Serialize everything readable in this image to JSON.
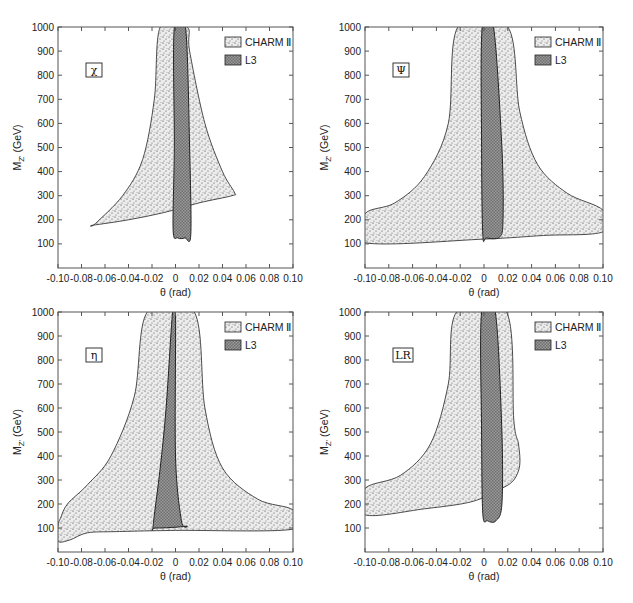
{
  "chart_data": [
    {
      "type": "area",
      "panel": "top-left",
      "model_label": "χ",
      "xlabel": "θ (rad)",
      "ylabel": "M_Z' (GeV)",
      "xlim": [
        -0.1,
        0.1
      ],
      "ylim": [
        0,
        1000
      ],
      "x_ticks": [
        "-0.10",
        "-0.08",
        "-0.06",
        "-0.04",
        "-0.02",
        "0",
        "0.02",
        "0.04",
        "0.06",
        "0.08",
        "0.10"
      ],
      "y_ticks": [
        "100",
        "200",
        "300",
        "400",
        "500",
        "600",
        "700",
        "800",
        "900",
        "1000"
      ],
      "legend": [
        "CHARM II",
        "L3"
      ],
      "series": [
        {
          "name": "CHARM II",
          "points": [
            [
              -0.013,
              1000
            ],
            [
              -0.018,
              700
            ],
            [
              -0.028,
              450
            ],
            [
              -0.045,
              300
            ],
            [
              -0.068,
              185
            ],
            [
              -0.07,
              178
            ],
            [
              -0.04,
              200
            ],
            [
              -0.01,
              230
            ],
            [
              0.02,
              270
            ],
            [
              0.048,
              300
            ],
            [
              0.05,
              315
            ],
            [
              0.04,
              400
            ],
            [
              0.025,
              600
            ],
            [
              0.012,
              900
            ],
            [
              0.01,
              1000
            ]
          ]
        },
        {
          "name": "L3",
          "points": [
            [
              -0.001,
              1000
            ],
            [
              -0.001,
              500
            ],
            [
              -0.002,
              160
            ],
            [
              0.002,
              125
            ],
            [
              0.008,
              125
            ],
            [
              0.013,
              140
            ],
            [
              0.012,
              500
            ],
            [
              0.0085,
              1000
            ]
          ]
        }
      ]
    },
    {
      "type": "area",
      "panel": "top-right",
      "model_label": "ψ",
      "xlabel": "θ (rad)",
      "ylabel": "M_Z' (GeV)",
      "xlim": [
        -0.1,
        0.1
      ],
      "ylim": [
        0,
        1000
      ],
      "x_ticks": [
        "-0.10",
        "-0.08",
        "-0.06",
        "-0.04",
        "-0.02",
        "0",
        "0.02",
        "0.04",
        "0.06",
        "0.08",
        "0.10"
      ],
      "y_ticks": [
        "100",
        "200",
        "300",
        "400",
        "500",
        "600",
        "700",
        "800",
        "900",
        "1000"
      ],
      "legend": [
        "CHARM II",
        "L3"
      ],
      "series": [
        {
          "name": "CHARM II",
          "points": [
            [
              -0.022,
              1000
            ],
            [
              -0.03,
              600
            ],
            [
              -0.05,
              380
            ],
            [
              -0.075,
              270
            ],
            [
              -0.1,
              225
            ],
            [
              -0.1,
              105
            ],
            [
              0,
              120
            ],
            [
              0.05,
              135
            ],
            [
              0.1,
              150
            ],
            [
              0.1,
              240
            ],
            [
              0.07,
              310
            ],
            [
              0.045,
              430
            ],
            [
              0.03,
              650
            ],
            [
              0.02,
              1000
            ]
          ]
        },
        {
          "name": "L3",
          "points": [
            [
              -0.0015,
              1000
            ],
            [
              -0.002,
              500
            ],
            [
              -0.001,
              140
            ],
            [
              0.002,
              125
            ],
            [
              0.013,
              128
            ],
            [
              0.016,
              200
            ],
            [
              0.015,
              500
            ],
            [
              0.008,
              1000
            ]
          ]
        }
      ]
    },
    {
      "type": "area",
      "panel": "bottom-left",
      "model_label": "η",
      "xlabel": "θ (rad)",
      "ylabel": "M_Z' (GeV)",
      "xlim": [
        -0.1,
        0.1
      ],
      "ylim": [
        0,
        1000
      ],
      "x_ticks": [
        "-0.10",
        "-0.08",
        "-0.06",
        "-0.04",
        "-0.02",
        "0",
        "0.02",
        "0.04",
        "0.06",
        "0.08",
        "0.10"
      ],
      "y_ticks": [
        "100",
        "200",
        "300",
        "400",
        "500",
        "600",
        "700",
        "800",
        "900",
        "1000"
      ],
      "legend": [
        "CHARM II",
        "L3"
      ],
      "series": [
        {
          "name": "CHARM II",
          "points": [
            [
              -0.024,
              1000
            ],
            [
              -0.035,
              650
            ],
            [
              -0.055,
              400
            ],
            [
              -0.075,
              280
            ],
            [
              -0.092,
              200
            ],
            [
              -0.098,
              140
            ],
            [
              -0.1,
              110
            ],
            [
              -0.1,
              45
            ],
            [
              -0.09,
              50
            ],
            [
              -0.075,
              80
            ],
            [
              -0.05,
              85
            ],
            [
              0,
              90
            ],
            [
              0.1,
              95
            ],
            [
              0.1,
              175
            ],
            [
              0.07,
              220
            ],
            [
              0.04,
              350
            ],
            [
              0.025,
              600
            ],
            [
              0.016,
              1000
            ]
          ]
        },
        {
          "name": "L3",
          "points": [
            [
              -0.0025,
              1000
            ],
            [
              -0.008,
              600
            ],
            [
              -0.013,
              350
            ],
            [
              -0.019,
              110
            ],
            [
              -0.017,
              100
            ],
            [
              0.009,
              108
            ],
            [
              0.005,
              130
            ],
            [
              0,
              400
            ],
            [
              0,
              1000
            ]
          ]
        }
      ]
    },
    {
      "type": "area",
      "panel": "bottom-right",
      "model_label": "LR",
      "xlabel": "θ (rad)",
      "ylabel": "M_Z' (GeV)",
      "xlim": [
        -0.1,
        0.1
      ],
      "ylim": [
        0,
        1000
      ],
      "x_ticks": [
        "-0.10",
        "-0.08",
        "-0.06",
        "-0.04",
        "-0.02",
        "0",
        "0.02",
        "0.04",
        "0.06",
        "0.08",
        "0.10"
      ],
      "y_ticks": [
        "100",
        "200",
        "300",
        "400",
        "500",
        "600",
        "700",
        "800",
        "900",
        "1000"
      ],
      "legend": [
        "CHARM II",
        "L3"
      ],
      "series": [
        {
          "name": "CHARM II",
          "points": [
            [
              -0.023,
              1000
            ],
            [
              -0.03,
              700
            ],
            [
              -0.045,
              450
            ],
            [
              -0.07,
              320
            ],
            [
              -0.1,
              265
            ],
            [
              -0.1,
              155
            ],
            [
              -0.05,
              180
            ],
            [
              -0.01,
              210
            ],
            [
              0.015,
              265
            ],
            [
              0.025,
              300
            ],
            [
              0.03,
              360
            ],
            [
              0.029,
              450
            ],
            [
              0.025,
              550
            ],
            [
              0.019,
              1000
            ]
          ]
        },
        {
          "name": "L3",
          "points": [
            [
              -0.002,
              1000
            ],
            [
              -0.002,
              500
            ],
            [
              -0.001,
              160
            ],
            [
              0.003,
              130
            ],
            [
              0.01,
              130
            ],
            [
              0.015,
              200
            ],
            [
              0.015,
              500
            ],
            [
              0.0095,
              1000
            ]
          ]
        }
      ]
    }
  ],
  "panels": [
    {
      "model_label": "χ",
      "legend_charm": "CHARM Ⅱ",
      "legend_l3": "L3",
      "xlabel": "θ (rad)",
      "ylabel_main": "M",
      "ylabel_sub": "Z'",
      "ylabel_unit": " (GeV)"
    },
    {
      "model_label": "Ψ",
      "legend_charm": "CHARM Ⅱ",
      "legend_l3": "L3",
      "xlabel": "θ (rad)",
      "ylabel_main": "M",
      "ylabel_sub": "Z'",
      "ylabel_unit": " (GeV)"
    },
    {
      "model_label": "η",
      "legend_charm": "CHARM Ⅱ",
      "legend_l3": "L3",
      "xlabel": "θ (rad)",
      "ylabel_main": "M",
      "ylabel_sub": "Z'",
      "ylabel_unit": " (GeV)"
    },
    {
      "model_label": "LR",
      "legend_charm": "CHARM Ⅱ",
      "legend_l3": "L3",
      "xlabel": "θ (rad)",
      "ylabel_main": "M",
      "ylabel_sub": "Z'",
      "ylabel_unit": " (GeV)"
    }
  ],
  "x_ticks": [
    "-0.10",
    "-0.08",
    "-0.06",
    "-0.04",
    "-0.02",
    "0",
    "0.02",
    "0.04",
    "0.06",
    "0.08",
    "0.10"
  ],
  "y_ticks": [
    "100",
    "200",
    "300",
    "400",
    "500",
    "600",
    "700",
    "800",
    "900",
    "1000"
  ],
  "colors": {
    "charm_fill": "#d8d8d8",
    "l3_fill": "#8c8c8c",
    "outline": "#222222",
    "axis": "#555555"
  }
}
